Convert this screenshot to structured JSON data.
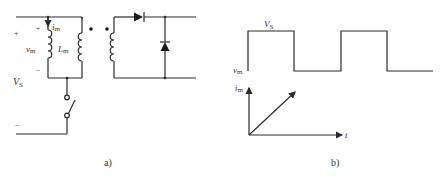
{
  "figure": {
    "panel_a": {
      "caption": "a)",
      "labels": {
        "source_plus": "+",
        "source_minus": "−",
        "source_name": "V",
        "source_sub": "S",
        "vm_plus": "+",
        "vm_minus": "−",
        "vm_name": "v",
        "vm_sub": "m",
        "im_name": "i",
        "im_sub": "m",
        "lm_name": "L",
        "lm_sub": "m"
      },
      "components": [
        "magnetizing-inductance",
        "primary-winding",
        "secondary-winding",
        "series-diode",
        "freewheeling-diode",
        "switch"
      ]
    },
    "panel_b": {
      "caption": "b)",
      "labels": {
        "vs_name": "V",
        "vs_sub": "S",
        "vm_name": "v",
        "vm_sub": "m",
        "im_name": "i",
        "im_sub": "m",
        "t_axis": "t"
      }
    }
  }
}
